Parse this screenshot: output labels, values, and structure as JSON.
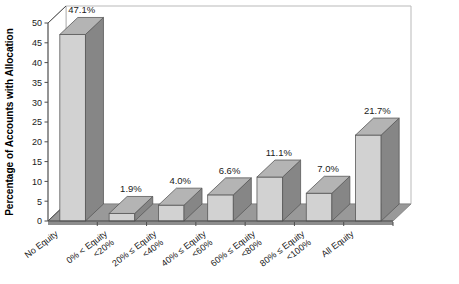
{
  "chart_data": {
    "type": "bar",
    "title": "",
    "subtitle": "",
    "xlabel": "",
    "ylabel": "Percentage of Accounts with Allocation",
    "ylim": [
      0,
      50
    ],
    "yticks": [
      0,
      5,
      10,
      15,
      20,
      25,
      30,
      35,
      40,
      45,
      50
    ],
    "ytick_labels": [
      "0",
      "5",
      "10",
      "15",
      "20",
      "25",
      "30",
      "35",
      "40",
      "45",
      "50"
    ],
    "grid": false,
    "legend": null,
    "legend_position": "none",
    "three_d": true,
    "categories": [
      "No Equity",
      "0% < Equity <20%",
      "20% ≤ Equity <40%",
      "40% ≤ Equity <60%",
      "60% ≤ Equity <80%",
      "80% ≤ Equity <100%",
      "All Equity"
    ],
    "category_lines": [
      [
        "No Equity",
        ""
      ],
      [
        "0% < Equity",
        "<20%"
      ],
      [
        "20% ≤ Equity",
        "<40%"
      ],
      [
        "40% ≤ Equity",
        "<60%"
      ],
      [
        "60% ≤ Equity",
        "<80%"
      ],
      [
        "80% ≤ Equity",
        "<100%"
      ],
      [
        "All Equity",
        ""
      ]
    ],
    "values": [
      47.1,
      1.9,
      4.0,
      6.6,
      11.1,
      7.0,
      21.7
    ],
    "data_labels": [
      "47.1%",
      "1.9%",
      "4.0%",
      "6.6%",
      "11.1%",
      "7.0%",
      "21.7%"
    ]
  },
  "style": {
    "bar_front": "#d2d2d2",
    "bar_side": "#868686",
    "bar_top": "#b4b4b4",
    "floor": "#999999",
    "floor_front": "#8d8d8d",
    "wall": "#ffffff",
    "wall_border": "#b9b9b9",
    "axis": "#4d4d4d",
    "text": "#1a1a1a"
  },
  "axis_labels": {
    "y_title": "Percentage of Accounts with Allocation"
  }
}
